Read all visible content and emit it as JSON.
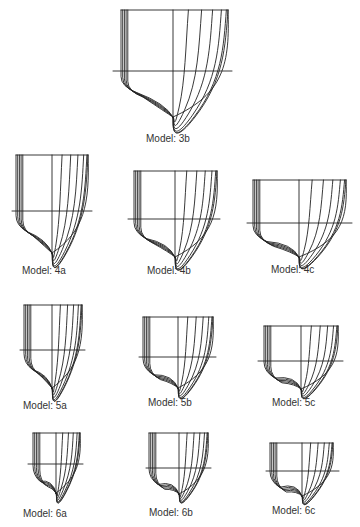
{
  "figure": {
    "type": "hull body plans",
    "models": [
      {
        "id": "3b",
        "label": "Model: 3b"
      },
      {
        "id": "4a",
        "label": "Model: 4a"
      },
      {
        "id": "4b",
        "label": "Model: 4b"
      },
      {
        "id": "4c",
        "label": "Model: 4c"
      },
      {
        "id": "5a",
        "label": "Model: 5a"
      },
      {
        "id": "5b",
        "label": "Model: 5b"
      },
      {
        "id": "5c",
        "label": "Model: 5c"
      },
      {
        "id": "6a",
        "label": "Model: 6a"
      },
      {
        "id": "6b",
        "label": "Model: 6b"
      },
      {
        "id": "6c",
        "label": "Model: 6c"
      }
    ]
  },
  "colors": {
    "line": "#222222",
    "text": "#333333",
    "background": "#ffffff"
  }
}
